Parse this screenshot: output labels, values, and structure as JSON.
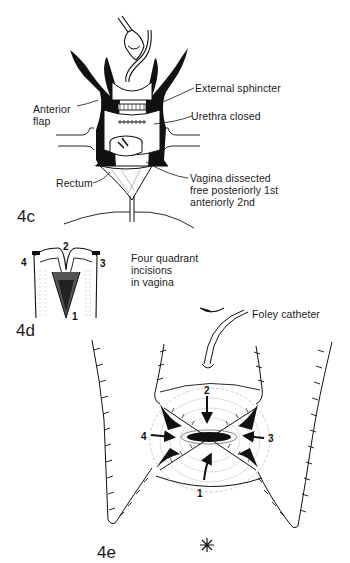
{
  "figure_4c": {
    "label": "4c",
    "annotations": {
      "external_sphincter": "External sphincter",
      "anterior_flap_line1": "Anterior",
      "anterior_flap_line2": "flap",
      "urethra_closed": "Urethra closed",
      "rectum": "Rectum",
      "vagina_line1": "Vagina dissected",
      "vagina_line2": "free posteriorly 1st",
      "vagina_line3": "anteriorly 2nd"
    }
  },
  "figure_4d": {
    "label": "4d",
    "caption_line1": "Four quadrant",
    "caption_line2": "incisions",
    "caption_line3": "in vagina",
    "quadrants": [
      "1",
      "2",
      "3",
      "4"
    ]
  },
  "figure_4e": {
    "label": "4e",
    "annotations": {
      "foley_catheter": "Foley catheter"
    },
    "quadrants": [
      "1",
      "2",
      "3",
      "4"
    ]
  }
}
